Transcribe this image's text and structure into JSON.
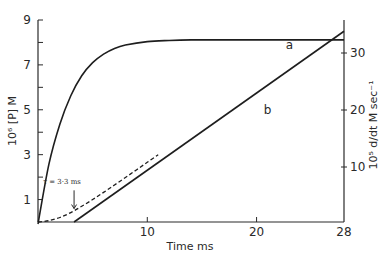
{
  "chart_data": {
    "type": "line",
    "title": "",
    "xlabel": "Time ms",
    "ylabel_left": "10⁶ [P] M",
    "ylabel_right": "10⁵ d/dt M sec⁻¹",
    "xlim": [
      0,
      28
    ],
    "ylim_left": [
      0,
      9
    ],
    "ylim_right": [
      0,
      35
    ],
    "grid": false,
    "x_ticks": [
      {
        "value": 10,
        "label": "10"
      },
      {
        "value": 20,
        "label": "20"
      },
      {
        "value": 28,
        "label": "28"
      }
    ],
    "y_left_ticks": [
      {
        "value": 1,
        "label": "1"
      },
      {
        "value": 2,
        "label": ""
      },
      {
        "value": 3,
        "label": "3"
      },
      {
        "value": 4,
        "label": ""
      },
      {
        "value": 5,
        "label": "5"
      },
      {
        "value": 6,
        "label": ""
      },
      {
        "value": 7,
        "label": "7"
      },
      {
        "value": 8,
        "label": ""
      },
      {
        "value": 9,
        "label": "9"
      }
    ],
    "y_right_ticks": [
      {
        "value": 10,
        "label": "10"
      },
      {
        "value": 20,
        "label": "20"
      },
      {
        "value": 30,
        "label": "30"
      }
    ],
    "series": [
      {
        "name": "a",
        "axis": "right",
        "style": "solid",
        "x": [
          0,
          1,
          2,
          3,
          4,
          5,
          6,
          7,
          8,
          10,
          12,
          14,
          16,
          20,
          24,
          28
        ],
        "y": [
          0,
          10.5,
          17.5,
          22.5,
          26.0,
          28.3,
          29.8,
          30.8,
          31.4,
          32.0,
          32.2,
          32.3,
          32.3,
          32.3,
          32.3,
          32.3
        ]
      },
      {
        "name": "b",
        "axis": "left",
        "style": "solid",
        "x": [
          3.3,
          28
        ],
        "y": [
          0,
          8.5
        ]
      },
      {
        "name": "b-transient",
        "axis": "left",
        "style": "dashed",
        "x": [
          0,
          1,
          2,
          3,
          4,
          5,
          6,
          7,
          8,
          9,
          10,
          11
        ],
        "y": [
          0,
          0.06,
          0.2,
          0.42,
          0.7,
          1.0,
          1.32,
          1.65,
          1.98,
          2.32,
          2.66,
          3.0
        ]
      }
    ],
    "curve_labels": [
      {
        "series": "a",
        "text": "a",
        "x": 23,
        "y_right": 30.7
      },
      {
        "series": "b",
        "text": "b",
        "x": 21,
        "y_left": 4.8
      }
    ],
    "annotations": [
      {
        "text": "τ = 3·3 ms",
        "x": 3.3,
        "y_left": 1.5,
        "arrow_to_y_left": 0.6
      }
    ]
  }
}
